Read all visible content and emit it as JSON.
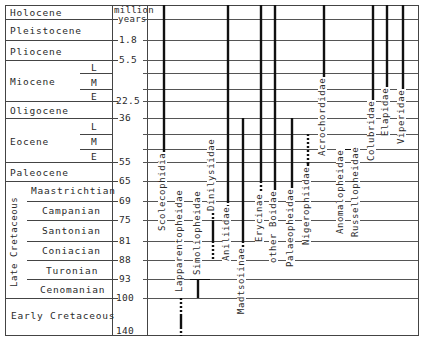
{
  "axis": {
    "unit_line1": "million",
    "unit_line2": "years",
    "ticks": [
      {
        "label": "1.8",
        "y": 40
      },
      {
        "label": "5.5",
        "y": 60
      },
      {
        "label": "22.5",
        "y": 101
      },
      {
        "label": "36",
        "y": 118
      },
      {
        "label": "55",
        "y": 162
      },
      {
        "label": "65",
        "y": 181
      },
      {
        "label": "69",
        "y": 201
      },
      {
        "label": "75",
        "y": 220
      },
      {
        "label": "81",
        "y": 241
      },
      {
        "label": "88",
        "y": 260
      },
      {
        "label": "93",
        "y": 279
      },
      {
        "label": "100",
        "y": 298
      },
      {
        "label": "140",
        "y": 336
      }
    ]
  },
  "epochs": [
    {
      "name": "Holocene"
    },
    {
      "name": "Pleistocene"
    },
    {
      "name": "Pliocene"
    },
    {
      "name": "Miocene",
      "subdivisions": [
        "L",
        "M",
        "E"
      ]
    },
    {
      "name": "Oligocene"
    },
    {
      "name": "Eocene",
      "subdivisions": [
        "L",
        "M",
        "E"
      ]
    },
    {
      "name": "Paleocene"
    },
    {
      "name": "Late Cretaceous",
      "stages": [
        "Maastrichtian",
        "Campanian",
        "Santonian",
        "Coniacian",
        "Turonian",
        "Cenomanian"
      ]
    },
    {
      "name": "Early Cretaceous"
    }
  ],
  "taxa": [
    {
      "name": "Scolecophidia"
    },
    {
      "name": "Lapparentopheidae"
    },
    {
      "name": "Simoliopheidae"
    },
    {
      "name": "Dinilysiidae"
    },
    {
      "name": "Aniliidae"
    },
    {
      "name": "Madtsoiinae"
    },
    {
      "name": "Erycinae"
    },
    {
      "name": "other Boidae"
    },
    {
      "name": "Palaeopheidae"
    },
    {
      "name": "Nigerophiidae"
    },
    {
      "name": "Acrochordidae"
    },
    {
      "name": "Anomalopheidae"
    },
    {
      "name": "Russellopheidae"
    },
    {
      "name": "Colubridae"
    },
    {
      "name": "Elapidae"
    },
    {
      "name": "Viperidae"
    }
  ],
  "legend_semantics": {
    "solid_line": "known fossil record",
    "dotted_line": "inferred range"
  },
  "colors": {
    "line": "#111111",
    "grid": "#444444",
    "text": "#2a2a2a"
  }
}
